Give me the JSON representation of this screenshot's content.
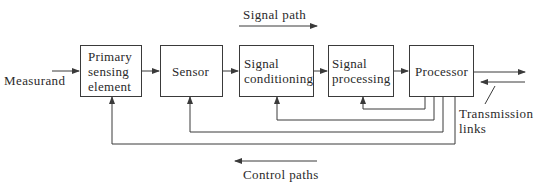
{
  "diagram": {
    "title_signal": "Signal path",
    "title_control": "Control paths",
    "input_label": "Measurand",
    "transmission_label_line1": "Transmission",
    "transmission_label_line2": "links",
    "blocks": [
      {
        "id": "primary",
        "line1": "Primary",
        "line2": "sensing",
        "line3": "element"
      },
      {
        "id": "sensor",
        "line1": "Sensor"
      },
      {
        "id": "conditioning",
        "line1": "Signal",
        "line2": "conditioning"
      },
      {
        "id": "processing",
        "line1": "Signal",
        "line2": "processing"
      },
      {
        "id": "processor",
        "line1": "Processor"
      }
    ],
    "feedback_paths": [
      {
        "from": "Processor",
        "to": "Signal processing"
      },
      {
        "from": "Processor",
        "to": "Signal conditioning"
      },
      {
        "from": "Processor",
        "to": "Sensor"
      },
      {
        "from": "Processor",
        "to": "Primary sensing element"
      }
    ],
    "colors": {
      "line": "#3a3a3a",
      "text": "#2a2a2a",
      "background": "#ffffff"
    }
  }
}
